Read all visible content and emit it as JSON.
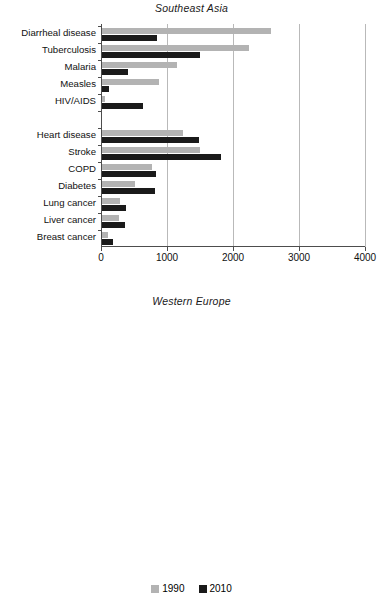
{
  "legend": {
    "entries": [
      {
        "label": "1990",
        "color": "#b3b3b3"
      },
      {
        "label": "2010",
        "color": "#1a1a1a"
      }
    ]
  },
  "axis": {
    "ticks": [
      "0",
      "1000",
      "2000",
      "3000",
      "4000"
    ]
  },
  "chart_data": [
    {
      "type": "bar",
      "orientation": "horizontal",
      "title": "Southeast Asia",
      "xlabel": "",
      "ylabel": "",
      "xlim": [
        0,
        4000
      ],
      "xticks": [
        0,
        1000,
        2000,
        3000,
        4000
      ],
      "grid": "vertical",
      "legend_position": "bottom-center",
      "categories": [
        "Diarrheal disease",
        "Tuberculosis",
        "Malaria",
        "Measles",
        "HIV/AIDS",
        "",
        "Heart disease",
        "Stroke",
        "COPD",
        "Diabetes",
        "Lung cancer",
        "Liver cancer",
        "Breast cancer"
      ],
      "series": [
        {
          "name": "1990",
          "color": "#b3b3b3",
          "values": [
            2560,
            2220,
            1140,
            860,
            45,
            null,
            1230,
            1490,
            760,
            500,
            275,
            260,
            90
          ]
        },
        {
          "name": "2010",
          "color": "#1a1a1a",
          "values": [
            835,
            1480,
            395,
            105,
            620,
            null,
            1475,
            1800,
            820,
            800,
            360,
            345,
            165
          ]
        }
      ]
    },
    {
      "type": "bar",
      "orientation": "horizontal",
      "title": "Western Europe",
      "xlabel": "",
      "ylabel": "",
      "xlim": [
        0,
        4000
      ],
      "xticks": [
        0,
        1000,
        2000,
        3000,
        4000
      ],
      "grid": "vertical",
      "legend_position": "bottom-center",
      "categories": [
        "Diarrheal disease",
        "Tuberculosis",
        "Malaria",
        "Measles",
        "HIV/AIDS",
        "",
        "Heart disease",
        "Stroke",
        "COPD",
        "Diabetes",
        "Lung cancer",
        "Liver cancer",
        "Breast cancer"
      ],
      "series": [
        {
          "name": "1990",
          "color": "#b3b3b3",
          "values": [
            120,
            60,
            5,
            3,
            135,
            null,
            3700,
            1700,
            850,
            680,
            1040,
            150,
            530
          ]
        },
        {
          "name": "2010",
          "color": "#1a1a1a",
          "values": [
            105,
            45,
            2,
            1,
            60,
            null,
            2340,
            1130,
            805,
            680,
            950,
            170,
            450
          ]
        }
      ]
    }
  ]
}
